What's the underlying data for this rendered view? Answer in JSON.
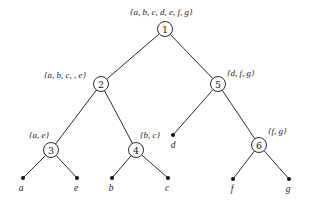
{
  "diagram": {
    "type": "binary-tree",
    "internal_nodes": [
      {
        "id": "1",
        "label": "1",
        "set": "{a, b, c, d, e, f, g}",
        "x": 165,
        "y": 29,
        "set_x": 130,
        "set_y": 15
      },
      {
        "id": "2",
        "label": "2",
        "set": "{a, b, c, , e}",
        "x": 101,
        "y": 84,
        "set_x": 44,
        "set_y": 78
      },
      {
        "id": "5",
        "label": "5",
        "set": "{d, f, g}",
        "x": 218,
        "y": 84,
        "set_x": 227,
        "set_y": 76
      },
      {
        "id": "3",
        "label": "3",
        "set": "{a, e}",
        "x": 51,
        "y": 150,
        "set_x": 29,
        "set_y": 138
      },
      {
        "id": "4",
        "label": "4",
        "set": "{b, c}",
        "x": 136,
        "y": 150,
        "set_x": 140,
        "set_y": 138
      },
      {
        "id": "6",
        "label": "6",
        "set": "{f, g}",
        "x": 259,
        "y": 145,
        "set_x": 268,
        "set_y": 134
      }
    ],
    "leaves": [
      {
        "id": "a",
        "label": "a",
        "x": 23,
        "y": 178,
        "lx": 21,
        "ly": 191
      },
      {
        "id": "e",
        "label": "e",
        "x": 77,
        "y": 178,
        "lx": 76,
        "ly": 191
      },
      {
        "id": "b",
        "label": "b",
        "x": 112,
        "y": 178,
        "lx": 111,
        "ly": 191
      },
      {
        "id": "c",
        "label": "c",
        "x": 168,
        "y": 178,
        "lx": 167,
        "ly": 191
      },
      {
        "id": "d",
        "label": "d",
        "x": 173,
        "y": 135,
        "lx": 173,
        "ly": 148
      },
      {
        "id": "f",
        "label": "f",
        "x": 233,
        "y": 179,
        "lx": 232,
        "ly": 192
      },
      {
        "id": "g",
        "label": "g",
        "x": 289,
        "y": 179,
        "lx": 288,
        "ly": 192
      }
    ],
    "edges": [
      [
        "1",
        "2"
      ],
      [
        "1",
        "5"
      ],
      [
        "2",
        "3"
      ],
      [
        "2",
        "4"
      ],
      [
        "5",
        "d"
      ],
      [
        "5",
        "6"
      ],
      [
        "3",
        "a"
      ],
      [
        "3",
        "e"
      ],
      [
        "4",
        "b"
      ],
      [
        "4",
        "c"
      ],
      [
        "6",
        "f"
      ],
      [
        "6",
        "g"
      ]
    ],
    "node_radius": 7.5,
    "colors": {
      "line": "#2a2a2a",
      "text": "#1a1a1a",
      "background": "#ffffff"
    }
  }
}
